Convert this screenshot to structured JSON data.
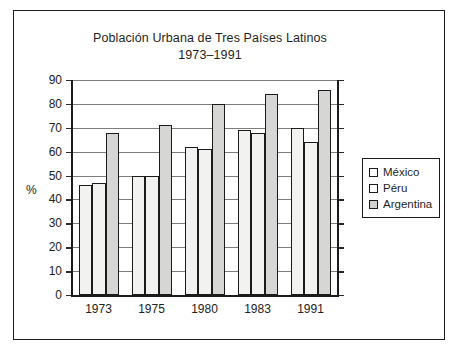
{
  "chart_data": {
    "type": "bar",
    "title": "Población Urbana de Tres Países Latinos",
    "subtitle": "1973–1991",
    "xlabel": "",
    "ylabel": "%",
    "ylim": [
      0,
      90
    ],
    "yticks": [
      0,
      10,
      20,
      30,
      40,
      50,
      60,
      70,
      80,
      90
    ],
    "grid": true,
    "legend_position": "right",
    "categories": [
      "1973",
      "1975",
      "1980",
      "1983",
      "1991"
    ],
    "series": [
      {
        "name": "México",
        "values": [
          46,
          50,
          62,
          69,
          70
        ],
        "color": "#f2f2f0"
      },
      {
        "name": "Péru",
        "values": [
          47,
          50,
          61,
          68,
          64
        ],
        "color": "#f2f2f0"
      },
      {
        "name": "Argentina",
        "values": [
          68,
          71,
          80,
          84,
          86
        ],
        "color": "#d6d6d4"
      }
    ]
  },
  "legend": {
    "items": [
      {
        "label": "México"
      },
      {
        "label": "Péru"
      },
      {
        "label": "Argentina"
      }
    ]
  }
}
